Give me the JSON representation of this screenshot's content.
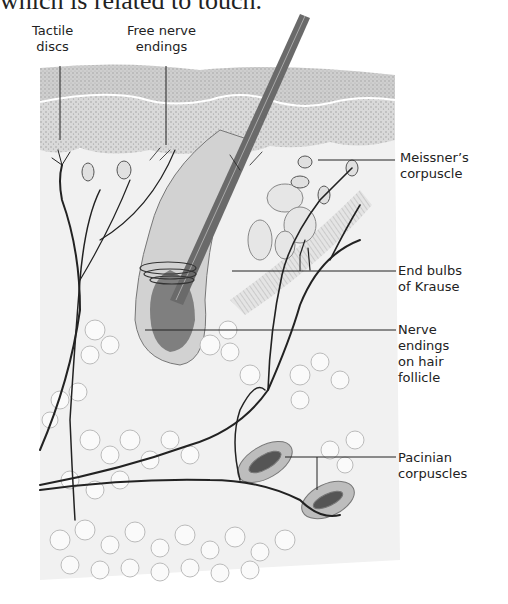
{
  "caption": "which is related to touch.",
  "figure": {
    "labels": {
      "tactile_discs": [
        "Tactile",
        "discs"
      ],
      "free_nerve_endings": [
        "Free nerve",
        "endings"
      ],
      "meissners_corpuscle": [
        "Meissner’s",
        "corpuscle"
      ],
      "end_bulbs_of_krause": [
        "End bulbs",
        "of Krause"
      ],
      "nerve_endings_on_hair_follicle": [
        "Nerve",
        "endings",
        "on hair",
        "follicle"
      ],
      "pacinian_corpuscles": [
        "Pacinian",
        "corpuscles"
      ]
    },
    "colors": {
      "ink": "#222222",
      "epidermis": "#c8c8c8",
      "dermis": "#ececec",
      "fat": "#f6f6f6",
      "hair": "#6a6a6a"
    }
  }
}
